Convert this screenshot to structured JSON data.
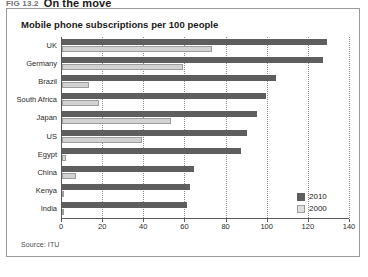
{
  "figure": {
    "number": "FIG 13.2",
    "heading": "On the move"
  },
  "panel": {
    "title": "Mobile phone subscriptions per 100 people",
    "source": "Source: ITU"
  },
  "legend": {
    "position": "bottom-right",
    "items": [
      {
        "label": "2010",
        "color": "#5e5e5e"
      },
      {
        "label": "2000",
        "color": "#e0e0e0"
      }
    ]
  },
  "axis": {
    "ticks": [
      "0",
      "20",
      "40",
      "60",
      "80",
      "100",
      "120",
      "140"
    ]
  },
  "chart_data": {
    "type": "bar",
    "orientation": "horizontal",
    "title": "Mobile phone subscriptions per 100 people",
    "xlabel": "",
    "ylabel": "",
    "xlim": [
      0,
      140
    ],
    "grid": true,
    "legend_position": "bottom-right",
    "source": "Source: ITU",
    "categories": [
      "UK",
      "Germany",
      "Brazil",
      "South Africa",
      "Japan",
      "US",
      "Egypt",
      "China",
      "Kenya",
      "India"
    ],
    "series": [
      {
        "name": "2010",
        "color": "#5e5e5e",
        "values": [
          129,
          127,
          104,
          99,
          95,
          90,
          87,
          64,
          62,
          61
        ]
      },
      {
        "name": "2000",
        "color": "#e0e0e0",
        "values": [
          73,
          59,
          13,
          18,
          53,
          39,
          2,
          7,
          1,
          0.4
        ]
      }
    ]
  }
}
